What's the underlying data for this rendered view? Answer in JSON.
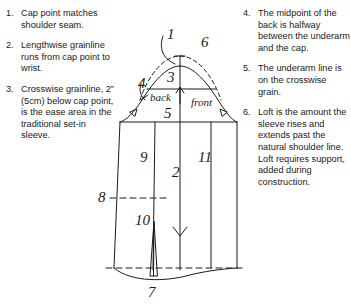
{
  "figure": {
    "ink_color": "#1a1a1a",
    "background_color": "#ffffff"
  },
  "notes_left": [
    {
      "number": "1.",
      "text": "Cap point matches shoulder seam."
    },
    {
      "number": "2.",
      "text": "Lengthwise grainline runs from cap point to wrist."
    },
    {
      "number": "3.",
      "text": "Crosswise grainline, 2” (5cm) below cap point, is the ease area in the traditional set-in sleeve."
    }
  ],
  "notes_right": [
    {
      "number": "4.",
      "text": "The midpoint of the back is halfway between the underarm and the cap."
    },
    {
      "number": "5.",
      "text": "The underarm line is on the crosswise grain."
    },
    {
      "number": "6.",
      "text": "Loft is the amount the sleeve rises and extends past the natural shoulder line. Loft requires support, added during construction."
    }
  ],
  "diagram_labels": {
    "n1": "1",
    "n2": "2",
    "n3": "3",
    "n4": "4",
    "n5": "5",
    "n6": "6",
    "n7": "7",
    "n8": "8",
    "n9": "9",
    "n10": "10",
    "n11": "11",
    "back": "back",
    "front": "front"
  }
}
